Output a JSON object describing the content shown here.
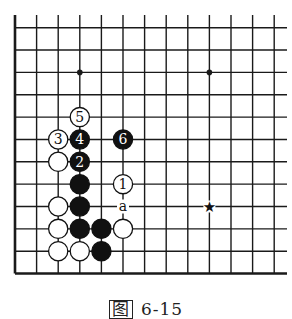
{
  "figure": {
    "caption_prefix": "图",
    "caption_number": "6-15"
  },
  "board": {
    "columns": 13,
    "rows": 12,
    "origin_x": 15,
    "origin_y": 27.7,
    "col_spacing": 21.6,
    "row_spacing": 22.35,
    "line_top": 15,
    "line_right": 287,
    "left_edge_thick": true,
    "bottom_edge_thick": true,
    "line_color": "#1a1a1a",
    "star_points": [
      {
        "col": 3,
        "row": 2
      },
      {
        "col": 9,
        "row": 2
      }
    ],
    "marked_point": {
      "col": 9,
      "row": 8,
      "symbol": "★"
    },
    "stones": [
      {
        "col": 3,
        "row": 4,
        "color": "white",
        "label": "5"
      },
      {
        "col": 2,
        "row": 5,
        "color": "white",
        "label": "3"
      },
      {
        "col": 3,
        "row": 5,
        "color": "black",
        "label": "4"
      },
      {
        "col": 5,
        "row": 5,
        "color": "black",
        "label": "6"
      },
      {
        "col": 2,
        "row": 6,
        "color": "white",
        "label": ""
      },
      {
        "col": 3,
        "row": 6,
        "color": "black",
        "label": "2"
      },
      {
        "col": 3,
        "row": 7,
        "color": "black",
        "label": ""
      },
      {
        "col": 5,
        "row": 7,
        "color": "white",
        "label": "1"
      },
      {
        "col": 2,
        "row": 8,
        "color": "white",
        "label": ""
      },
      {
        "col": 3,
        "row": 8,
        "color": "black",
        "label": ""
      },
      {
        "col": 2,
        "row": 9,
        "color": "white",
        "label": ""
      },
      {
        "col": 3,
        "row": 9,
        "color": "black",
        "label": ""
      },
      {
        "col": 4,
        "row": 9,
        "color": "black",
        "label": ""
      },
      {
        "col": 5,
        "row": 9,
        "color": "white",
        "label": ""
      },
      {
        "col": 2,
        "row": 10,
        "color": "white",
        "label": ""
      },
      {
        "col": 3,
        "row": 10,
        "color": "white",
        "label": ""
      },
      {
        "col": 4,
        "row": 10,
        "color": "black",
        "label": ""
      }
    ],
    "point_labels": [
      {
        "col": 5,
        "row": 8,
        "text": "a"
      }
    ]
  }
}
